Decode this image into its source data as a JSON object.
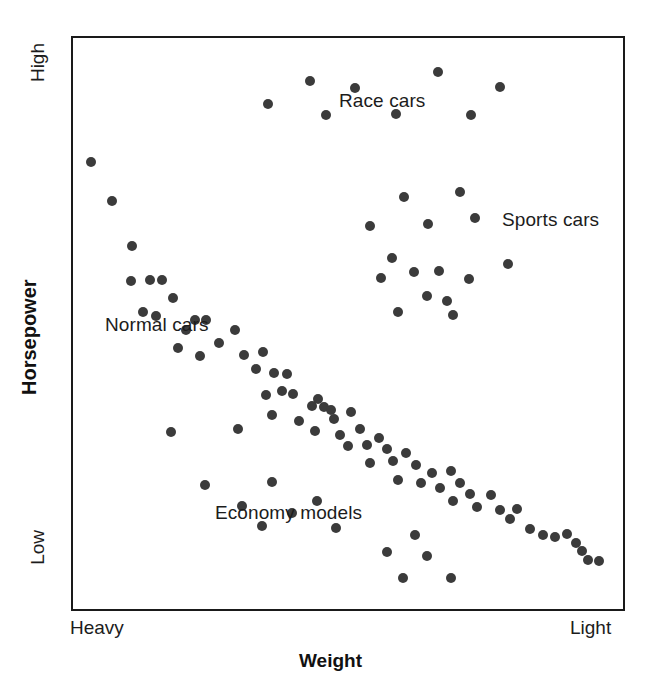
{
  "axes": {
    "y_title": "Horsepower",
    "x_title": "Weight",
    "y_high_label": "High",
    "y_low_label": "Low",
    "x_left_label": "Heavy",
    "x_right_label": "Light"
  },
  "annotations": {
    "race": "Race cars",
    "sports": "Sports cars",
    "normal": "Normal cars",
    "economy": "Economy models"
  },
  "style": {
    "point_color": "#3b3b3b",
    "frame_color": "#1a1a1a",
    "background": "#ffffff",
    "point_diameter_px": 10
  },
  "chart_data": {
    "type": "scatter",
    "title": "",
    "xlabel": "Weight",
    "ylabel": "Horsepower",
    "xlim": [
      0,
      100
    ],
    "ylim": [
      0,
      100
    ],
    "x_tick_labels": [
      "Heavy",
      "Light"
    ],
    "y_tick_labels": [
      "Low",
      "High"
    ],
    "grid": false,
    "legend": "none",
    "annotations": [
      {
        "text": "Race cars",
        "x": 38.0,
        "y": 87.0
      },
      {
        "text": "Sports cars",
        "x": 79.0,
        "y": 67.5
      },
      {
        "text": "Normal cars",
        "x": 7.5,
        "y": 50.5
      },
      {
        "text": "Economy models",
        "x": 27.5,
        "y": 18.5
      }
    ],
    "series": [
      {
        "name": "Normal cars",
        "color": "#3b3b3b",
        "points": [
          [
            3.3,
            78.2
          ],
          [
            7.0,
            71.5
          ],
          [
            10.7,
            63.5
          ],
          [
            10.5,
            57.5
          ],
          [
            14.0,
            57.7
          ],
          [
            16.2,
            57.7
          ],
          [
            12.8,
            52.0
          ],
          [
            15.0,
            51.3
          ],
          [
            18.2,
            54.5
          ],
          [
            20.6,
            48.8
          ],
          [
            22.2,
            50.6
          ],
          [
            24.2,
            50.7
          ],
          [
            19.0,
            45.7
          ],
          [
            23.1,
            44.3
          ],
          [
            26.5,
            46.6
          ],
          [
            29.4,
            48.8
          ],
          [
            31.1,
            44.5
          ],
          [
            34.6,
            45.0
          ],
          [
            33.3,
            42.0
          ],
          [
            36.6,
            41.3
          ],
          [
            38.9,
            41.2
          ],
          [
            35.0,
            37.5
          ],
          [
            38.0,
            38.1
          ],
          [
            40.0,
            37.6
          ],
          [
            36.2,
            33.9
          ],
          [
            41.0,
            33.0
          ],
          [
            43.4,
            35.6
          ],
          [
            44.6,
            36.8
          ],
          [
            45.6,
            35.4
          ],
          [
            46.9,
            34.8
          ],
          [
            47.4,
            33.3
          ],
          [
            44.0,
            31.2
          ],
          [
            48.6,
            30.5
          ],
          [
            50.6,
            34.5
          ],
          [
            52.2,
            31.6
          ],
          [
            50.0,
            28.5
          ],
          [
            53.5,
            28.8
          ],
          [
            55.6,
            30.0
          ],
          [
            57.0,
            28.0
          ],
          [
            54.0,
            25.6
          ],
          [
            58.2,
            25.9
          ],
          [
            60.6,
            27.4
          ],
          [
            62.4,
            25.2
          ],
          [
            59.0,
            22.6
          ],
          [
            63.3,
            22.1
          ],
          [
            65.2,
            23.8
          ],
          [
            66.8,
            21.2
          ],
          [
            68.8,
            24.2
          ],
          [
            70.4,
            22.1
          ],
          [
            69.0,
            19.0
          ],
          [
            72.2,
            20.2
          ],
          [
            73.5,
            17.8
          ],
          [
            76.0,
            19.9
          ],
          [
            77.6,
            17.4
          ],
          [
            79.4,
            15.8
          ],
          [
            80.8,
            17.6
          ],
          [
            83.0,
            14.0
          ],
          [
            85.4,
            13.0
          ],
          [
            87.6,
            12.6
          ],
          [
            89.8,
            13.2
          ],
          [
            91.4,
            11.6
          ],
          [
            92.6,
            10.2
          ],
          [
            93.6,
            8.5
          ],
          [
            95.6,
            8.4
          ]
        ]
      },
      {
        "name": "Race cars",
        "color": "#3b3b3b",
        "points": [
          [
            43.0,
            92.5
          ],
          [
            51.3,
            91.3
          ],
          [
            66.4,
            94.0
          ],
          [
            77.6,
            91.5
          ],
          [
            35.5,
            88.5
          ],
          [
            46.0,
            86.5
          ],
          [
            58.8,
            86.7
          ],
          [
            72.4,
            86.6
          ]
        ]
      },
      {
        "name": "Sports cars",
        "color": "#3b3b3b",
        "points": [
          [
            60.2,
            72.2
          ],
          [
            70.4,
            73.0
          ],
          [
            73.0,
            68.5
          ],
          [
            54.0,
            67.0
          ],
          [
            64.6,
            67.5
          ],
          [
            58.0,
            61.5
          ],
          [
            62.0,
            59.0
          ],
          [
            79.0,
            60.5
          ],
          [
            66.5,
            59.2
          ],
          [
            56.0,
            58.0
          ],
          [
            72.0,
            57.8
          ],
          [
            64.4,
            54.8
          ],
          [
            68.0,
            54.0
          ],
          [
            59.0,
            52.0
          ],
          [
            69.0,
            51.5
          ]
        ]
      },
      {
        "name": "Economy models",
        "color": "#3b3b3b",
        "points": [
          [
            17.8,
            31.0
          ],
          [
            30.0,
            31.5
          ],
          [
            24.0,
            21.8
          ],
          [
            36.2,
            22.2
          ],
          [
            30.8,
            18.0
          ],
          [
            39.8,
            16.8
          ],
          [
            44.4,
            19.0
          ],
          [
            34.4,
            14.5
          ],
          [
            47.8,
            14.2
          ],
          [
            62.2,
            13.0
          ],
          [
            57.0,
            10.0
          ],
          [
            64.4,
            9.2
          ],
          [
            60.0,
            5.5
          ],
          [
            68.8,
            5.4
          ]
        ]
      }
    ]
  }
}
